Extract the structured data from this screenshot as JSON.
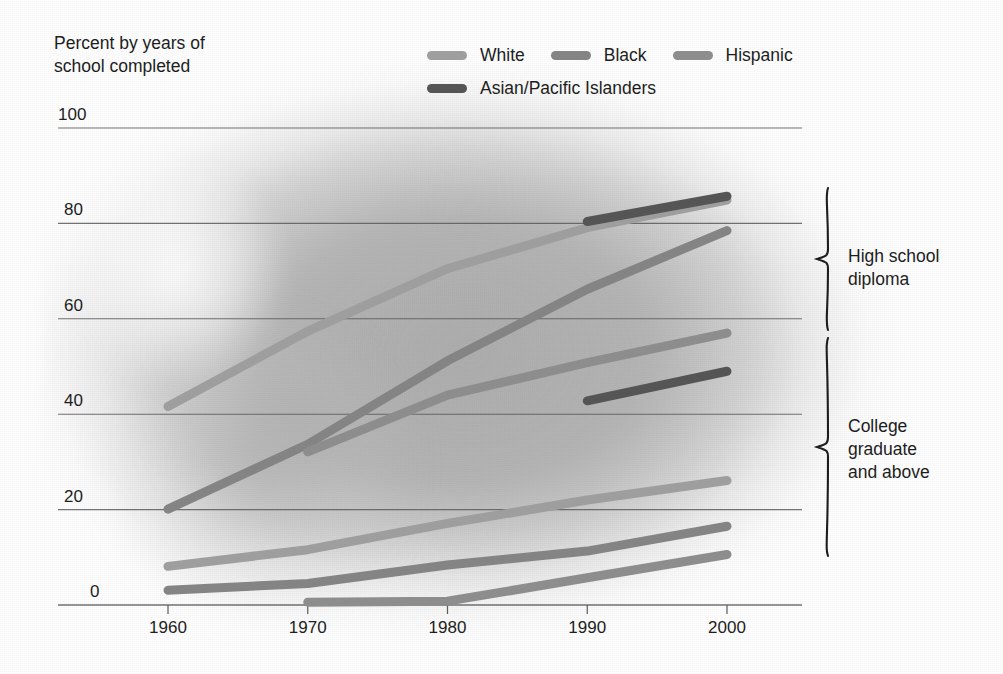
{
  "axis_title": "Percent by years of\nschool completed",
  "legend": {
    "rows": [
      [
        {
          "label": "White",
          "color": "#9e9e9e",
          "name": "legend-white"
        },
        {
          "label": "Black",
          "color": "#848484",
          "name": "legend-black"
        },
        {
          "label": "Hispanic",
          "color": "#8d8d8d",
          "name": "legend-hispanic"
        }
      ],
      [
        {
          "label": "Asian/Pacific Islanders",
          "color": "#555555",
          "name": "legend-asian-pacific-islanders"
        }
      ]
    ]
  },
  "annotations": [
    {
      "text": "High school\ndiploma",
      "name": "annotation-high-school-diploma"
    },
    {
      "text": "College\ngraduate\nand above",
      "name": "annotation-college-graduate"
    }
  ],
  "colors": {
    "white_series": "#9e9e9e",
    "black_series": "#848484",
    "hispanic_series": "#8d8d8d",
    "asian_series": "#555555",
    "gridline": "#5a5a5a",
    "axis_text": "#1d1d1d"
  },
  "chart_data": {
    "type": "line",
    "title": "Percent by years of school completed",
    "xlabel": "",
    "ylabel": "Percent by years of school completed",
    "xlim": [
      1960,
      2000
    ],
    "ylim": [
      0,
      100
    ],
    "xticks": [
      1960,
      1970,
      1980,
      1990,
      2000
    ],
    "yticks": [
      0,
      20,
      40,
      60,
      80,
      100
    ],
    "grid": true,
    "legend_position": "top",
    "groups": [
      "High school diploma",
      "College graduate and above"
    ],
    "series": [
      {
        "name": "White",
        "group": "High school diploma",
        "color": "#9e9e9e",
        "x": [
          1960,
          1970,
          1980,
          1990,
          2000
        ],
        "values": [
          41.6,
          57.4,
          70.5,
          79.1,
          84.9
        ]
      },
      {
        "name": "Black",
        "group": "High school diploma",
        "color": "#848484",
        "x": [
          1960,
          1970,
          1980,
          1990,
          2000
        ],
        "values": [
          20.1,
          33.7,
          51.2,
          66.2,
          78.5
        ]
      },
      {
        "name": "Hispanic",
        "group": "High school diploma",
        "color": "#8d8d8d",
        "x": [
          1970,
          1980,
          1990,
          2000
        ],
        "values": [
          32.1,
          44.0,
          50.8,
          57.0
        ]
      },
      {
        "name": "Asian/Pacific Islanders",
        "group": "High school diploma",
        "color": "#555555",
        "x": [
          1990,
          2000
        ],
        "values": [
          80.4,
          85.7
        ]
      },
      {
        "name": "White",
        "group": "College graduate and above",
        "color": "#9e9e9e",
        "x": [
          1960,
          1970,
          1980,
          1990,
          2000
        ],
        "values": [
          8.1,
          11.6,
          17.1,
          22.0,
          26.1
        ]
      },
      {
        "name": "Black",
        "group": "College graduate and above",
        "color": "#848484",
        "x": [
          1960,
          1970,
          1980,
          1990,
          2000
        ],
        "values": [
          3.1,
          4.5,
          8.4,
          11.3,
          16.5
        ]
      },
      {
        "name": "Hispanic",
        "group": "College graduate and above",
        "color": "#8d8d8d",
        "x": [
          1970,
          1980,
          1990,
          2000
        ],
        "values": [
          0.6,
          0.8,
          5.7,
          10.6
        ]
      },
      {
        "name": "Asian/Pacific Islanders",
        "group": "College graduate and above",
        "color": "#555555",
        "x": [
          1990,
          2000
        ],
        "values": [
          42.8,
          49.0
        ]
      }
    ]
  },
  "geometry": {
    "x0_px": 168,
    "x1_px": 727,
    "x0_val": 1960,
    "x1_val": 2000,
    "y0_px": 605,
    "y1_px": 128,
    "y0_val": 0,
    "y1_val": 100,
    "axis_left_px": 58,
    "axis_right_px": 802,
    "line_width": 9
  },
  "brace_bounds": {
    "high_school": {
      "top": 188,
      "bottom": 330,
      "x": 828,
      "label_x": 848,
      "label_y": 245
    },
    "college": {
      "top": 338,
      "bottom": 556,
      "x": 828,
      "label_x": 848,
      "label_y": 415
    }
  }
}
